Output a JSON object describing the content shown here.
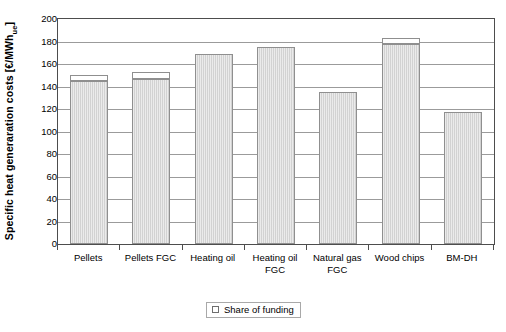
{
  "chart_data": {
    "type": "bar",
    "title": "",
    "subtitle": "",
    "xlabel": "",
    "ylabel": "Specific heat generaration costs [€/MWh",
    "ylabel_subscript": "ue",
    "ylabel_suffix": "]",
    "categories": [
      "Pellets",
      "Pellets FGC",
      "Heating oil",
      "Heating oil FGC",
      "Natural gas FGC",
      "Wood chips",
      "BM-DH"
    ],
    "ylim": [
      0,
      200
    ],
    "ytick_values": [
      0,
      20,
      40,
      60,
      80,
      100,
      120,
      140,
      160,
      180,
      200
    ],
    "ytick_labels": [
      "0",
      "20",
      "40",
      "60",
      "80",
      "100",
      "120",
      "140",
      "160",
      "180",
      "200"
    ],
    "grid": true,
    "legend_position": "bottom",
    "legend": [
      {
        "label": "Share of funding",
        "color": "#ffffff"
      }
    ],
    "series": [
      {
        "name": "Specific heat generation costs",
        "color": "#d2d2d2",
        "values": [
          145,
          147,
          169,
          175,
          135,
          178,
          117
        ]
      },
      {
        "name": "Share of funding",
        "color": "#ffffff",
        "values": [
          5,
          6,
          0,
          0,
          0,
          5,
          0
        ]
      }
    ],
    "totals": [
      150,
      153,
      169,
      175,
      135,
      183,
      117
    ]
  }
}
